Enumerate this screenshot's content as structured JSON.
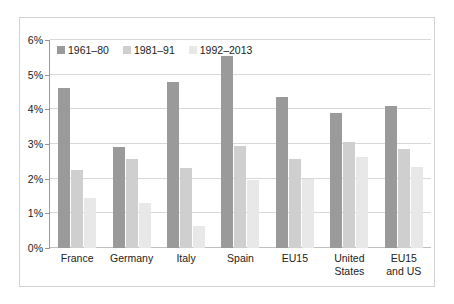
{
  "chart_data": {
    "type": "bar",
    "title": "",
    "subtitle": "",
    "xlabel": "",
    "ylabel": "",
    "ylim": [
      0,
      6
    ],
    "ytick_labels": [
      "0%",
      "1%",
      "2%",
      "3%",
      "4%",
      "5%",
      "6%"
    ],
    "ytick_values": [
      0,
      1,
      2,
      3,
      4,
      5,
      6
    ],
    "grid": true,
    "legend_position": "top-left-inside",
    "categories": [
      "France",
      "Germany",
      "Italy",
      "Spain",
      "EU15",
      "United\nStates",
      "EU15\nand US"
    ],
    "series": [
      {
        "name": "1961–80",
        "color": "#9a9a9a",
        "values": [
          4.62,
          2.9,
          4.78,
          5.55,
          4.35,
          3.89,
          4.11
        ]
      },
      {
        "name": "1981–91",
        "color": "#cfcfcf",
        "values": [
          2.24,
          2.58,
          2.32,
          2.94,
          2.58,
          3.07,
          2.85
        ]
      },
      {
        "name": "1992–2013",
        "color": "#e8e8e8",
        "values": [
          1.44,
          1.3,
          0.64,
          1.95,
          2.0,
          2.62,
          2.33
        ]
      }
    ]
  },
  "legend": {
    "items": [
      {
        "label": "1961–80"
      },
      {
        "label": "1981–91"
      },
      {
        "label": "1992–2013"
      }
    ]
  },
  "axes": {
    "y": {
      "ticks": [
        "6%",
        "5%",
        "4%",
        "3%",
        "2%",
        "1%",
        "0%"
      ]
    },
    "x": {
      "labels": [
        "France",
        "Germany",
        "Italy",
        "Spain",
        "EU15",
        "United\nStates",
        "EU15\nand US"
      ]
    }
  },
  "colors": {
    "series_1961_80": "#9a9a9a",
    "series_1981_91": "#cfcfcf",
    "series_1992_2013": "#e8e8e8",
    "gridline": "#d8d8d8",
    "axis": "#9a9a9a",
    "frame": "#d2d2d2",
    "text": "#222222",
    "background": "#ffffff"
  }
}
